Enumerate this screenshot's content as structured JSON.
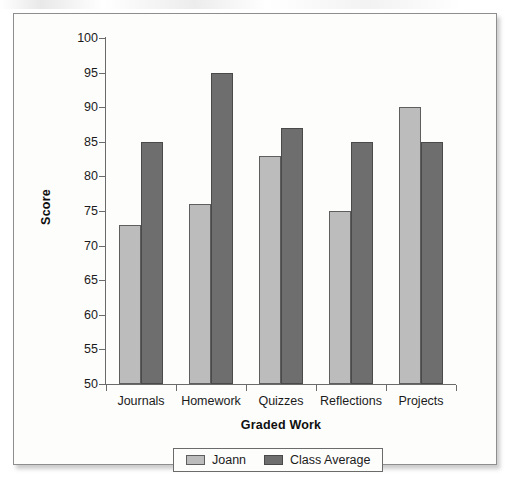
{
  "chart_data": {
    "type": "bar",
    "title": "",
    "subtitle": "",
    "xlabel": "Graded Work",
    "ylabel": "Score",
    "categories": [
      "Journals",
      "Homework",
      "Quizzes",
      "Reflections",
      "Projects"
    ],
    "series": [
      {
        "name": "Joann",
        "color": "#bcbcbc",
        "values": [
          73,
          76,
          83,
          75,
          90
        ]
      },
      {
        "name": "Class Average",
        "color": "#6e6e6e",
        "values": [
          85,
          95,
          87,
          85,
          85
        ]
      }
    ],
    "ylim": [
      50,
      100
    ],
    "ytick_step": 5,
    "yticks": [
      50,
      55,
      60,
      65,
      70,
      75,
      80,
      85,
      90,
      95,
      100
    ],
    "ytick_labels": [
      "50",
      "55",
      "60",
      "65",
      "70",
      "75",
      "80",
      "85",
      "90",
      "95",
      "100"
    ],
    "grid": false,
    "legend_position": "bottom",
    "orientation": "vertical",
    "bar_grouping": "grouped"
  },
  "figure": {
    "background_color": "#fdfdfc",
    "border_color": "#8e8e8e",
    "axis_color": "#6b6b6b",
    "text_color": "#1b1b1b"
  },
  "legend": {
    "entries": [
      {
        "label": "Joann",
        "color": "#bcbcbc"
      },
      {
        "label": "Class Average",
        "color": "#6e6e6e"
      }
    ]
  }
}
